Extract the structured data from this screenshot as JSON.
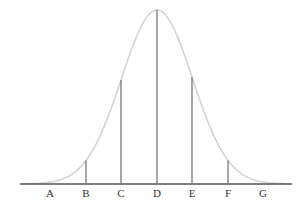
{
  "diagram": {
    "type": "normal-distribution-curve",
    "colors": {
      "curve": "#d4d4d4",
      "axis": "#555555",
      "lines": "#777777",
      "labels": "#333333"
    },
    "geometry": {
      "baseline_y": 184,
      "peak_y": 10,
      "axis_x_start": 20,
      "axis_x_end": 292,
      "mean_x": 157,
      "sigma_px": 35.5
    },
    "markers": [
      {
        "label": "A",
        "x": 50,
        "sigma": -3,
        "line": false
      },
      {
        "label": "B",
        "x": 86,
        "sigma": -2,
        "line": true
      },
      {
        "label": "C",
        "x": 121,
        "sigma": -1,
        "line": true
      },
      {
        "label": "D",
        "x": 157,
        "sigma": 0,
        "line": true
      },
      {
        "label": "E",
        "x": 192,
        "sigma": 1,
        "line": true
      },
      {
        "label": "F",
        "x": 228,
        "sigma": 2,
        "line": true
      },
      {
        "label": "G",
        "x": 263,
        "sigma": 3,
        "line": false
      }
    ]
  }
}
